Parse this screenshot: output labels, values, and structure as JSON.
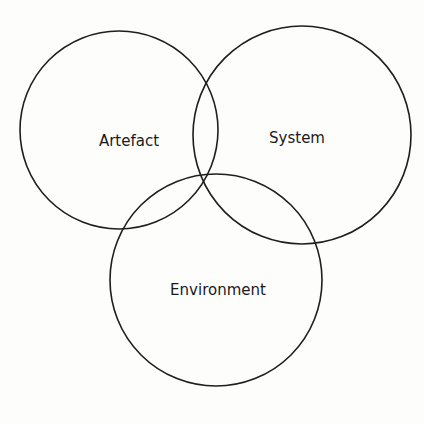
{
  "diagram": {
    "type": "venn",
    "sets": [
      {
        "id": "artefact",
        "label": "Artefact",
        "cx": 119,
        "cy": 130,
        "r": 99,
        "label_x": 129,
        "label_y": 146
      },
      {
        "id": "system",
        "label": "System",
        "cx": 302,
        "cy": 135,
        "r": 109,
        "label_x": 297,
        "label_y": 143
      },
      {
        "id": "environment",
        "label": "Environment",
        "cx": 216,
        "cy": 280,
        "r": 106,
        "label_x": 218,
        "label_y": 295
      }
    ],
    "stroke_color": "#1e1e1e",
    "background": "#fdfdfc"
  }
}
